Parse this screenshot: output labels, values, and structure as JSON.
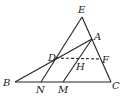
{
  "diagram": {
    "type": "geometry-figure",
    "points": {
      "E": {
        "label": "E",
        "x": 82,
        "y": 17,
        "lx": 78,
        "ly": 13
      },
      "A": {
        "label": "A",
        "x": 92,
        "y": 39,
        "lx": 94,
        "ly": 40
      },
      "D": {
        "label": "D",
        "x": 56,
        "y": 58,
        "lx": 48,
        "ly": 61
      },
      "F": {
        "label": "F",
        "x": 101,
        "y": 59,
        "lx": 102,
        "ly": 63
      },
      "H": {
        "label": "H",
        "x": 78,
        "y": 59,
        "lx": 76,
        "ly": 70
      },
      "B": {
        "label": "B",
        "x": 15,
        "y": 82,
        "lx": 3,
        "ly": 86
      },
      "N": {
        "label": "N",
        "x": 41,
        "y": 82,
        "lx": 36,
        "ly": 93
      },
      "M": {
        "label": "M",
        "x": 63,
        "y": 82,
        "lx": 58,
        "ly": 93
      },
      "C": {
        "label": "C",
        "x": 111,
        "y": 82,
        "lx": 112,
        "ly": 89
      }
    },
    "segments": [
      {
        "from": "E",
        "to": "C",
        "style": "solid"
      },
      {
        "from": "B",
        "to": "C",
        "style": "solid"
      },
      {
        "from": "B",
        "to": "A",
        "style": "solid"
      },
      {
        "from": "E",
        "to": "N",
        "style": "solid"
      },
      {
        "from": "A",
        "to": "M",
        "style": "solid"
      },
      {
        "from": "D",
        "to": "F",
        "style": "dashed"
      }
    ]
  }
}
